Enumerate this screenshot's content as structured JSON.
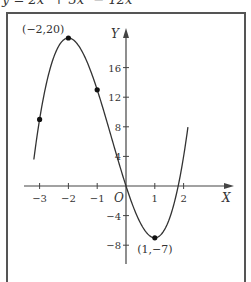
{
  "chart_data": {
    "type": "line",
    "title": "y = 2x³ + 3x² − 12x",
    "function": "2x^3 + 3x^2 - 12x",
    "xlabel": "X",
    "ylabel": "Y",
    "origin_label": "O",
    "xlim": [
      -3.45,
      3.75
    ],
    "ylim": [
      -10,
      21
    ],
    "curve_x_range": [
      -3.2,
      2.15
    ],
    "grid": false,
    "x_ticks": [
      {
        "value": -3,
        "label": "−3"
      },
      {
        "value": -2,
        "label": "−2"
      },
      {
        "value": -1,
        "label": "−1"
      },
      {
        "value": 1,
        "label": "1"
      },
      {
        "value": 2,
        "label": "2"
      }
    ],
    "y_ticks": [
      {
        "value": 16,
        "label": "16"
      },
      {
        "value": 12,
        "label": "12"
      },
      {
        "value": 8,
        "label": "8"
      },
      {
        "value": 4,
        "label": "4"
      },
      {
        "value": -4,
        "label": "−4"
      },
      {
        "value": -8,
        "label": "−8"
      }
    ],
    "points": [
      {
        "x": -3,
        "y": 9,
        "label": ""
      },
      {
        "x": -2,
        "y": 20,
        "label": "(−2,20)"
      },
      {
        "x": -1,
        "y": 13,
        "label": ""
      },
      {
        "x": 1,
        "y": -7,
        "label": "(1,−7)"
      }
    ]
  }
}
